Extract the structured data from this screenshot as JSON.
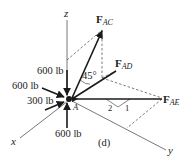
{
  "figure": {
    "label": "(d)",
    "point": "A",
    "axes": {
      "x": "x",
      "y": "y",
      "z": "z"
    },
    "angle_label": "45°",
    "slope": {
      "run": "2",
      "rise": "1"
    }
  },
  "forces": {
    "ac": {
      "symbol": "F",
      "sub": "AC"
    },
    "ad": {
      "symbol": "F",
      "sub": "AD"
    },
    "ae": {
      "symbol": "F",
      "sub": "AE"
    }
  },
  "loads": {
    "z_down": "600 lb",
    "left_upper": "600 lb",
    "x_dir": "300 lb",
    "bottom_up": "600 lb"
  },
  "colors": {
    "line": "#1a1a1a",
    "dashed": "#444444",
    "axis": "#555555"
  }
}
